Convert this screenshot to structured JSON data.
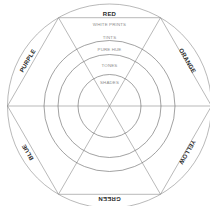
{
  "diagram": {
    "type": "color-wheel",
    "hues": [
      {
        "label": "RED",
        "position": "top"
      },
      {
        "label": "ORANGE",
        "position": "upper-right"
      },
      {
        "label": "YELLOW",
        "position": "lower-right"
      },
      {
        "label": "GREEN",
        "position": "bottom"
      },
      {
        "label": "BLUE",
        "position": "lower-left"
      },
      {
        "label": "PURPLE",
        "position": "upper-left"
      }
    ],
    "rings": [
      {
        "label": "WHITE PRINTS"
      },
      {
        "label": "TINTS"
      },
      {
        "label": "PURE HUE"
      },
      {
        "label": "TONES"
      },
      {
        "label": "SHADES"
      }
    ]
  }
}
